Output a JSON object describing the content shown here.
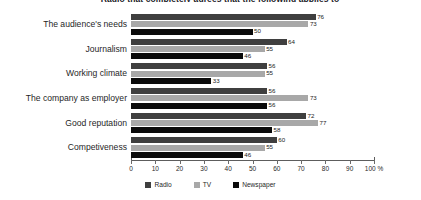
{
  "chart_data": {
    "type": "bar",
    "orientation": "horizontal",
    "title": "Radio that completely agrees that the following applies to",
    "categories": [
      "The audience's needs",
      "Journalism",
      "Working climate",
      "The company as employer",
      "Good reputation",
      "Competiveness"
    ],
    "series": [
      {
        "name": "Radio",
        "color": "#3f3f3f",
        "values": [
          76,
          64,
          56,
          56,
          72,
          60
        ]
      },
      {
        "name": "TV",
        "color": "#a8a8a8",
        "values": [
          73,
          55,
          55,
          73,
          77,
          55
        ]
      },
      {
        "name": "Newspaper",
        "color": "#0a0a0a",
        "values": [
          50,
          46,
          33,
          56,
          58,
          46
        ]
      }
    ],
    "xlabel": "",
    "ylabel": "",
    "xlim": [
      0,
      100
    ],
    "xticks": [
      0,
      10,
      20,
      30,
      40,
      50,
      60,
      70,
      80,
      90,
      100
    ],
    "xtick_labels": [
      "0",
      "10",
      "20",
      "30",
      "40",
      "50",
      "60",
      "70",
      "80",
      "90",
      "100 %"
    ],
    "unit": "%",
    "grid": false,
    "legend_position": "bottom",
    "data_labels": true
  }
}
